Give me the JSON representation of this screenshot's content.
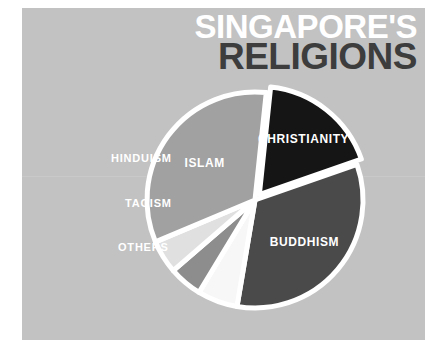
{
  "title": {
    "line1": "SINGAPORE'S",
    "line2": "RELIGIONS"
  },
  "colors": {
    "panel_background": "#c2c2c2",
    "page_background": "#ffffff",
    "title_line1": "#ffffff",
    "title_line2": "#3d3d3d",
    "separator": "#ffffff",
    "label_text": "#ffffff"
  },
  "chart_data": {
    "type": "pie",
    "title": "SINGAPORE'S RELIGIONS",
    "subtitle": "",
    "xlabel": "",
    "ylabel": "",
    "legend_position": "none",
    "grid": false,
    "center": {
      "x": 255,
      "y": 200
    },
    "radius": 108,
    "start_angle_deg": -84,
    "separator_width": 5,
    "categories": [
      "CHRISTIANITY",
      "BUDDHISM",
      "OTHERS",
      "TAOISM",
      "HINDUISM",
      "ISLAM"
    ],
    "values": [
      18,
      33,
      6,
      5,
      5,
      33
    ],
    "slices": [
      {
        "label": "CHRISTIANITY",
        "value": 18,
        "color": "#151515",
        "exploded": true,
        "explode_offset": 7,
        "label_placement": "inside",
        "label_font_size": 12,
        "label_radius_factor": 0.66
      },
      {
        "label": "BUDDHISM",
        "value": 33,
        "color": "#4a4a4a",
        "exploded": false,
        "explode_offset": 0,
        "label_placement": "inside",
        "label_font_size": 12,
        "label_radius_factor": 0.6
      },
      {
        "label": "OTHERS",
        "value": 6,
        "color": "#f7f7f7",
        "exploded": false,
        "explode_offset": 0,
        "label_placement": "outside-left",
        "label_font_size": 11,
        "label_x": 118,
        "label_y": 247
      },
      {
        "label": "TAOISM",
        "value": 5,
        "color": "#8d8d8d",
        "exploded": false,
        "explode_offset": 0,
        "label_placement": "outside-left",
        "label_font_size": 11,
        "label_x": 125,
        "label_y": 203
      },
      {
        "label": "HINDUISM",
        "value": 5,
        "color": "#e0e0e0",
        "exploded": false,
        "explode_offset": 0,
        "label_placement": "outside-left",
        "label_font_size": 11,
        "label_x": 111,
        "label_y": 158
      },
      {
        "label": "ISLAM",
        "value": 33,
        "color": "#a1a1a1",
        "exploded": false,
        "explode_offset": 0,
        "label_placement": "inside",
        "label_font_size": 12,
        "label_radius_factor": 0.58
      }
    ]
  }
}
